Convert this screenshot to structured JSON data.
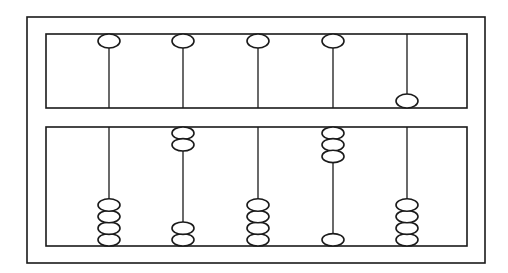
{
  "diagram": {
    "type": "abacus",
    "style": "soroban",
    "stroke_color": "#1a1a1a",
    "background": "#ffffff",
    "outer_frame": {
      "x": 27,
      "y": 17,
      "width": 458,
      "height": 246
    },
    "upper_deck": {
      "x": 46,
      "y": 34,
      "width": 421,
      "height": 74
    },
    "lower_deck": {
      "x": 46,
      "y": 127,
      "width": 421,
      "height": 119
    },
    "bead": {
      "rx": 11,
      "ry": 7,
      "earth_ry": 6.2,
      "earth_pitch": 11.6
    },
    "rods": [
      {
        "x": 109,
        "heaven": "up",
        "earth_top": 0,
        "earth_bottom": 4,
        "value": 0
      },
      {
        "x": 183,
        "heaven": "up",
        "earth_top": 2,
        "earth_bottom": 2,
        "value": 2
      },
      {
        "x": 258,
        "heaven": "up",
        "earth_top": 0,
        "earth_bottom": 4,
        "value": 0
      },
      {
        "x": 333,
        "heaven": "up",
        "earth_top": 3,
        "earth_bottom": 1,
        "value": 3
      },
      {
        "x": 407,
        "heaven": "down",
        "earth_top": 0,
        "earth_bottom": 4,
        "value": 5
      }
    ]
  }
}
